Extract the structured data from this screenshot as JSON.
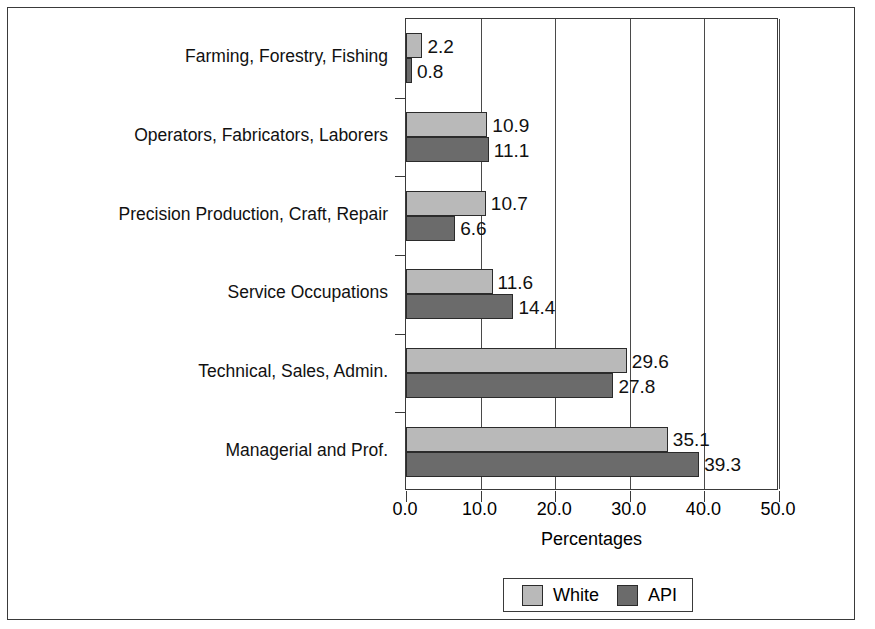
{
  "chart_data": {
    "type": "bar",
    "orientation": "horizontal",
    "grouped": true,
    "title": "",
    "xlabel": "Percentages",
    "ylabel": "",
    "xlim": [
      0.0,
      50.0
    ],
    "xticks": [
      "0.0",
      "10.0",
      "20.0",
      "30.0",
      "40.0",
      "50.0"
    ],
    "xtick_values": [
      0.0,
      10.0,
      20.0,
      30.0,
      40.0,
      50.0
    ],
    "grid": "vertical",
    "legend_position": "bottom-center",
    "categories": [
      "Farming, Forestry, Fishing",
      "Operators, Fabricators, Laborers",
      "Precision Production, Craft, Repair",
      "Service Occupations",
      "Technical, Sales, Admin.",
      "Managerial and Prof."
    ],
    "series": [
      {
        "name": "White",
        "color": "#b9b9b9",
        "values": [
          2.2,
          10.9,
          10.7,
          11.6,
          29.6,
          35.1
        ],
        "labels": [
          "2.2",
          "10.9",
          "10.7",
          "11.6",
          "29.6",
          "35.1"
        ]
      },
      {
        "name": "API",
        "color": "#6b6b6b",
        "values": [
          0.8,
          11.1,
          6.6,
          14.4,
          27.8,
          39.3
        ],
        "labels": [
          "0.8",
          "11.1",
          "6.6",
          "14.4",
          "27.8",
          "39.3"
        ]
      }
    ]
  },
  "legend": {
    "entries": [
      {
        "label": "White",
        "color": "#b9b9b9"
      },
      {
        "label": "API",
        "color": "#6b6b6b"
      }
    ]
  },
  "axis": {
    "x_title": "Percentages"
  },
  "colors": {
    "series_white": "#b9b9b9",
    "series_api": "#6b6b6b",
    "frame": "#3a3a3a",
    "bar_outline": "#2b2b2b",
    "background": "#ffffff"
  }
}
